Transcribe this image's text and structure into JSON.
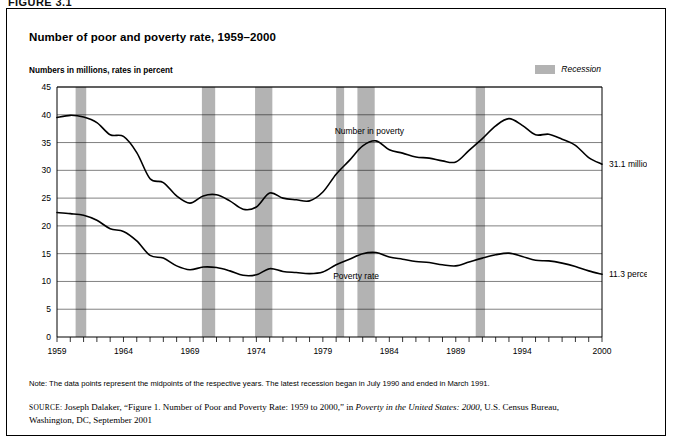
{
  "figure_kicker": "FIGURE 3.1",
  "title": "Number of poor and poverty rate, 1959–2000",
  "axis_caption": "Numbers in millions, rates in percent",
  "legend": {
    "recession_label": "Recession",
    "recession_color": "#b3b3b3"
  },
  "annotations": {
    "number_label": "Number in poverty",
    "rate_label": "Poverty rate",
    "number_end": "31.1 million",
    "rate_end": "11.3 percent"
  },
  "note": "Note: The data points represent the midpoints of the respective years. The latest recession began in July 1990 and ended in March 1991.",
  "source": {
    "label": "SOURCE:",
    "line1_a": " Joseph Dalaker, “Figure 1. Number of Poor and Poverty Rate: 1959 to 2000,” in ",
    "line1_italic": "Poverty in the United States: 2000,",
    "line1_b": " U.S. Census Bureau,",
    "line2": "Washington, DC, September 2001"
  },
  "chart_data": {
    "type": "line",
    "title": "Number of poor and poverty rate, 1959–2000",
    "xlabel": "",
    "ylabel": "Numbers in millions, rates in percent",
    "xlim": [
      1959,
      2000
    ],
    "ylim": [
      0,
      45
    ],
    "yticks": [
      0,
      5,
      10,
      15,
      20,
      25,
      30,
      35,
      40,
      45
    ],
    "xticks_labeled": [
      1959,
      1964,
      1969,
      1974,
      1979,
      1984,
      1989,
      1994,
      2000
    ],
    "grid": "horizontal",
    "legend_position": "top-right",
    "x": [
      1959,
      1960,
      1961,
      1962,
      1963,
      1964,
      1965,
      1966,
      1967,
      1968,
      1969,
      1970,
      1971,
      1972,
      1973,
      1974,
      1975,
      1976,
      1977,
      1978,
      1979,
      1980,
      1981,
      1982,
      1983,
      1984,
      1985,
      1986,
      1987,
      1988,
      1989,
      1990,
      1991,
      1992,
      1993,
      1994,
      1995,
      1996,
      1997,
      1998,
      1999,
      2000
    ],
    "series": [
      {
        "name": "Number in poverty",
        "unit": "millions",
        "end_value": 31.1,
        "values": [
          39.5,
          39.9,
          39.6,
          38.6,
          36.4,
          36.1,
          33.2,
          28.5,
          27.8,
          25.4,
          24.1,
          25.4,
          25.6,
          24.5,
          23.0,
          23.4,
          25.9,
          25.0,
          24.7,
          24.5,
          26.1,
          29.3,
          31.8,
          34.4,
          35.3,
          33.7,
          33.1,
          32.4,
          32.2,
          31.7,
          31.5,
          33.6,
          35.7,
          38.0,
          39.3,
          38.1,
          36.4,
          36.5,
          35.6,
          34.5,
          32.3,
          31.1
        ]
      },
      {
        "name": "Poverty rate",
        "unit": "percent",
        "end_value": 11.3,
        "values": [
          22.4,
          22.2,
          21.9,
          21.0,
          19.5,
          19.0,
          17.3,
          14.7,
          14.2,
          12.8,
          12.1,
          12.6,
          12.5,
          11.9,
          11.1,
          11.2,
          12.3,
          11.8,
          11.6,
          11.4,
          11.7,
          13.0,
          14.0,
          15.0,
          15.2,
          14.4,
          14.0,
          13.6,
          13.4,
          13.0,
          12.8,
          13.5,
          14.2,
          14.8,
          15.1,
          14.5,
          13.8,
          13.7,
          13.3,
          12.7,
          11.9,
          11.3
        ]
      }
    ],
    "recessions": [
      {
        "start": 1960.4,
        "end": 1961.2
      },
      {
        "start": 1969.9,
        "end": 1970.9
      },
      {
        "start": 1973.9,
        "end": 1975.2
      },
      {
        "start": 1980.0,
        "end": 1980.6
      },
      {
        "start": 1981.6,
        "end": 1982.9
      },
      {
        "start": 1990.5,
        "end": 1991.2
      }
    ]
  }
}
